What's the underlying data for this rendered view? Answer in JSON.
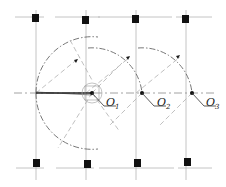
{
  "diagram": {
    "title": "",
    "colors": {
      "ink": "#1a1a1a",
      "dash": "#8a8a8a",
      "grid": "#b5b5b5"
    },
    "columns_x": [
      36,
      86,
      136,
      186
    ],
    "rows_y": [
      21,
      163
    ],
    "axis_y": 93,
    "points": [
      {
        "id": "O1",
        "label": "O",
        "sub": "1",
        "x": 92,
        "y": 93
      },
      {
        "id": "O2",
        "label": "O",
        "sub": "2",
        "x": 142,
        "y": 93
      },
      {
        "id": "O3",
        "label": "O",
        "sub": "3",
        "x": 192,
        "y": 93
      }
    ],
    "labels": {
      "o1": "O",
      "o1_sub": "1",
      "o2": "O",
      "o2_sub": "2",
      "o3": "O",
      "o3_sub": "3"
    }
  }
}
